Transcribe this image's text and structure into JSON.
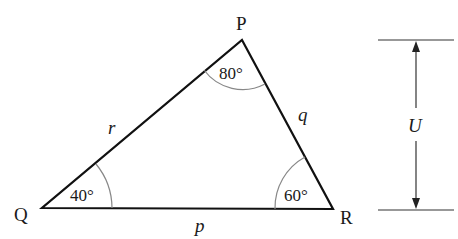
{
  "diagram": {
    "type": "triangle",
    "vertices": {
      "P": {
        "label": "P",
        "angle": "80°"
      },
      "Q": {
        "label": "Q",
        "angle": "40°"
      },
      "R": {
        "label": "R",
        "angle": "60°"
      }
    },
    "sides": {
      "p": {
        "label": "p",
        "between": "Q-R"
      },
      "q": {
        "label": "q",
        "between": "P-R"
      },
      "r": {
        "label": "r",
        "between": "P-Q"
      }
    },
    "dimension": {
      "label": "U",
      "description": "vertical height from base QR level to P level"
    },
    "colors": {
      "stroke": "#111111",
      "arc": "#888888",
      "text": "#1a1a1a"
    }
  }
}
